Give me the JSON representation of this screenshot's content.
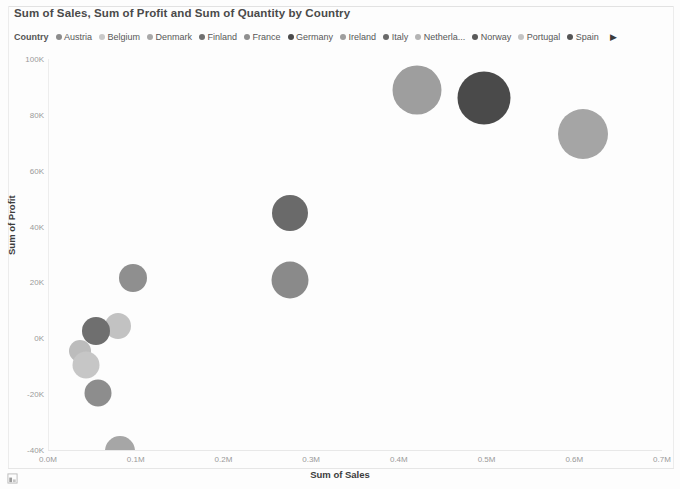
{
  "header": {
    "title": "Sum of Sales, Sum of Profit and Sum of Quantity by Country"
  },
  "legend": {
    "title": "Country",
    "next_label": "▶",
    "items": [
      {
        "label": "Austria",
        "color": "#8c8c8c"
      },
      {
        "label": "Belgium",
        "color": "#c9c9c9"
      },
      {
        "label": "Denmark",
        "color": "#a8a8a8"
      },
      {
        "label": "Finland",
        "color": "#6f6f6f"
      },
      {
        "label": "France",
        "color": "#8f8f8f"
      },
      {
        "label": "Germany",
        "color": "#4a4a4a"
      },
      {
        "label": "Ireland",
        "color": "#9e9e9e"
      },
      {
        "label": "Italy",
        "color": "#6a6a6a"
      },
      {
        "label": "Netherla...",
        "color": "#b4b4b4"
      },
      {
        "label": "Norway",
        "color": "#5a5a5a"
      },
      {
        "label": "Portugal",
        "color": "#c4c4c4"
      },
      {
        "label": "Spain",
        "color": "#555555"
      }
    ]
  },
  "footer": {
    "focus_icon": "focus-mode-icon"
  },
  "chart_data": {
    "type": "scatter",
    "title": "Sum of Sales, Sum of Profit and Sum of Quantity by Country",
    "xlabel": "Sum of Sales",
    "ylabel": "Sum of Profit",
    "size_field": "Sum of Quantity",
    "xlim": [
      0.0,
      0.7
    ],
    "ylim": [
      -40000,
      100000
    ],
    "x_tick_labels": [
      "0.0M",
      "0.1M",
      "0.2M",
      "0.3M",
      "0.4M",
      "0.5M",
      "0.6M",
      "0.7M"
    ],
    "x_tick_values": [
      0.0,
      0.1,
      0.2,
      0.3,
      0.4,
      0.5,
      0.6,
      0.7
    ],
    "y_tick_labels": [
      "100K",
      "80K",
      "60K",
      "40K",
      "20K",
      "0K",
      "-20K",
      "-40K"
    ],
    "y_tick_values": [
      100000,
      80000,
      60000,
      40000,
      20000,
      0,
      -20000,
      -40000
    ],
    "grid": false,
    "legend_position": "top",
    "points": [
      {
        "name": "Germany",
        "x": 0.497,
        "y": 86000,
        "size": 53,
        "color": "#4a4a4a"
      },
      {
        "name": "Ireland",
        "x": 0.421,
        "y": 89000,
        "size": 49,
        "color": "#9e9e9e"
      },
      {
        "name": "Spain",
        "x": 0.61,
        "y": 73000,
        "size": 50,
        "color": "#a5a5a5"
      },
      {
        "name": "Italy",
        "x": 0.276,
        "y": 45000,
        "size": 36,
        "color": "#6a6a6a"
      },
      {
        "name": "Netherlands",
        "x": 0.276,
        "y": 21000,
        "size": 37,
        "color": "#8a8a8a"
      },
      {
        "name": "France",
        "x": 0.097,
        "y": 21500,
        "size": 28,
        "color": "#8f8f8f"
      },
      {
        "name": "Belgium",
        "x": 0.08,
        "y": 4500,
        "size": 26,
        "color": "#c2c2c2"
      },
      {
        "name": "Finland",
        "x": 0.055,
        "y": 2500,
        "size": 28,
        "color": "#6f6f6f"
      },
      {
        "name": "Denmark",
        "x": 0.036,
        "y": -4500,
        "size": 22,
        "color": "#bcbcbc"
      },
      {
        "name": "Austria",
        "x": 0.043,
        "y": -9500,
        "size": 27,
        "color": "#c6c6c6"
      },
      {
        "name": "Norway",
        "x": 0.057,
        "y": -19500,
        "size": 27,
        "color": "#8d8d8d"
      },
      {
        "name": "Portugal",
        "x": 0.082,
        "y": -40500,
        "size": 30,
        "color": "#a6a6a6"
      }
    ]
  }
}
